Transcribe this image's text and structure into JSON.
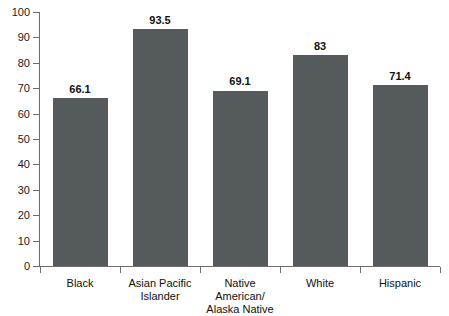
{
  "chart_data": {
    "type": "bar",
    "title": "",
    "xlabel": "",
    "ylabel": "",
    "categories": [
      "Black",
      "Asian Pacific\nIslander",
      "Native American/\nAlaska Native",
      "White",
      "Hispanic"
    ],
    "values": [
      66.1,
      93.5,
      69.1,
      83,
      71.4
    ],
    "value_labels": [
      "66.1",
      "93.5",
      "69.1",
      "83",
      "71.4"
    ],
    "ylim": [
      0,
      100
    ],
    "ytick_labels": [
      "0",
      "10",
      "20",
      "30",
      "40",
      "50",
      "60",
      "70",
      "80",
      "90",
      "100"
    ],
    "ytick_values": [
      0,
      10,
      20,
      30,
      40,
      50,
      60,
      70,
      80,
      90,
      100
    ],
    "grid": false,
    "legend": null,
    "bar_color": "#555a5c",
    "axis_color": "#6d6d6d",
    "text_color": "#101010",
    "background_color": "#ffffff"
  }
}
